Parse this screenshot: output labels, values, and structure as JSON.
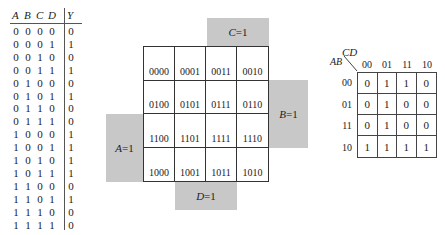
{
  "truth_table": {
    "headers": [
      "A",
      "B",
      "C",
      "D",
      "Y"
    ],
    "rows": [
      [
        "0",
        "0",
        "0",
        "0",
        "0"
      ],
      [
        "0",
        "0",
        "0",
        "1",
        "1"
      ],
      [
        "0",
        "0",
        "1",
        "0",
        "0"
      ],
      [
        "0",
        "0",
        "1",
        "1",
        "1"
      ],
      [
        "0",
        "1",
        "0",
        "0",
        "0"
      ],
      [
        "0",
        "1",
        "0",
        "1",
        "1"
      ],
      [
        "0",
        "1",
        "1",
        "0",
        "0"
      ],
      [
        "0",
        "1",
        "1",
        "1",
        "0"
      ],
      [
        "1",
        "0",
        "0",
        "0",
        "1"
      ],
      [
        "1",
        "0",
        "0",
        "1",
        "1"
      ],
      [
        "1",
        "0",
        "1",
        "0",
        "1"
      ],
      [
        "1",
        "0",
        "1",
        "1",
        "1"
      ],
      [
        "1",
        "1",
        "0",
        "0",
        "0"
      ],
      [
        "1",
        "1",
        "0",
        "1",
        "1"
      ],
      [
        "1",
        "1",
        "1",
        "0",
        "0"
      ],
      [
        "1",
        "1",
        "1",
        "1",
        "0"
      ]
    ]
  },
  "kmap_template": {
    "cells": [
      [
        "0000",
        "0001",
        "0011",
        "0010"
      ],
      [
        "0100",
        "0101",
        "0111",
        "0110"
      ],
      [
        "1100",
        "1101",
        "1111",
        "1110"
      ],
      [
        "1000",
        "1001",
        "1011",
        "1010"
      ]
    ],
    "labels": {
      "c": "C=1",
      "b": "B=1",
      "a": "A=1",
      "d": "D=1"
    }
  },
  "kmap_filled": {
    "corner_top": "CD",
    "corner_left": "AB",
    "col_headers": [
      "00",
      "01",
      "11",
      "10"
    ],
    "row_headers": [
      "00",
      "01",
      "11",
      "10"
    ],
    "values": [
      [
        "0",
        "1",
        "1",
        "0"
      ],
      [
        "0",
        "1",
        "0",
        "0"
      ],
      [
        "0",
        "1",
        "0",
        "0"
      ],
      [
        "1",
        "1",
        "1",
        "1"
      ]
    ]
  }
}
